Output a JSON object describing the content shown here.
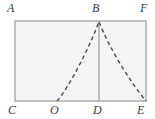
{
  "figure": {
    "type": "geometry-diagram",
    "canvas": {
      "width": 155,
      "height": 119
    },
    "colors": {
      "background": "#ffffff",
      "rectangle_fill": "#f5f5f3",
      "rectangle_stroke": "#9a9a9a",
      "segment_stroke": "#9a9a9a",
      "curve_stroke": "#4a4a4a",
      "label_color": "#3a3a3a"
    },
    "rectangle": {
      "name": "ACEF",
      "left": 15,
      "top": 21,
      "right": 146,
      "bottom": 101
    },
    "points": [
      {
        "id": "A",
        "label": "A",
        "x": 15,
        "y": 21,
        "role": "rectangle-corner-top-left"
      },
      {
        "id": "B",
        "label": "B",
        "x": 99,
        "y": 21,
        "role": "curve-vertex-on-top-edge"
      },
      {
        "id": "F",
        "label": "F",
        "x": 146,
        "y": 21,
        "role": "rectangle-corner-top-right"
      },
      {
        "id": "C",
        "label": "C",
        "x": 15,
        "y": 101,
        "role": "rectangle-corner-bottom-left"
      },
      {
        "id": "O",
        "label": "O",
        "x": 57,
        "y": 101,
        "role": "curve-intersection-on-bottom-edge"
      },
      {
        "id": "D",
        "label": "D",
        "x": 99,
        "y": 101,
        "role": "foot-of-vertical-segment"
      },
      {
        "id": "E",
        "label": "E",
        "x": 146,
        "y": 101,
        "role": "rectangle-corner-bottom-right"
      }
    ],
    "segments": [
      {
        "id": "BD",
        "from": "B",
        "to": "D",
        "style": "solid",
        "stroke": "#9a9a9a",
        "width": 1.2
      }
    ],
    "curve": {
      "id": "parabola-OBE",
      "style": "dashed",
      "dash_pattern": "4 3",
      "stroke": "#4a4a4a",
      "width": 1.4,
      "through": [
        "O",
        "B",
        "E"
      ],
      "path": "M 57 101 C 70 86 90 46 99 21.5 C 108 46 130 82 146 101"
    }
  }
}
